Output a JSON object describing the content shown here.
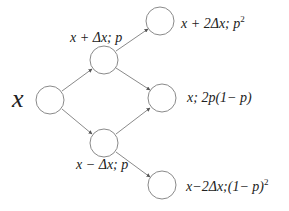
{
  "diagram": {
    "type": "binomial-tree",
    "colors": {
      "stroke": "#8a8a8a",
      "text": "#222222",
      "background": "#ffffff"
    },
    "nodes": [
      {
        "id": "root",
        "cx": 50,
        "cy": 100,
        "r": 14,
        "label": "x"
      },
      {
        "id": "up",
        "cx": 104,
        "cy": 60,
        "r": 14,
        "label": "x + Δx; p"
      },
      {
        "id": "down",
        "cx": 104,
        "cy": 143,
        "r": 14,
        "label": "x − Δx; p"
      },
      {
        "id": "upup",
        "cx": 160,
        "cy": 21,
        "r": 14,
        "label": "x + 2Δx; p²"
      },
      {
        "id": "mid",
        "cx": 162,
        "cy": 98,
        "r": 14,
        "label": "x; 2p(1− p)"
      },
      {
        "id": "downdown",
        "cx": 162,
        "cy": 185,
        "r": 14,
        "label": "x−2Δx;(1− p)²"
      }
    ],
    "edges": [
      {
        "from": "root",
        "to": "up"
      },
      {
        "from": "root",
        "to": "down"
      },
      {
        "from": "up",
        "to": "upup"
      },
      {
        "from": "up",
        "to": "mid"
      },
      {
        "from": "down",
        "to": "mid"
      },
      {
        "from": "down",
        "to": "downdown"
      }
    ],
    "labels": {
      "root": "x",
      "up": "x + Δx; p",
      "down": "x − Δx; p",
      "upup_a": "x + 2Δx; p",
      "upup_sup": "2",
      "mid": "x; 2p(1− p)",
      "downdown_a": "x−2Δx;(1− p)",
      "downdown_sup": "2"
    }
  }
}
